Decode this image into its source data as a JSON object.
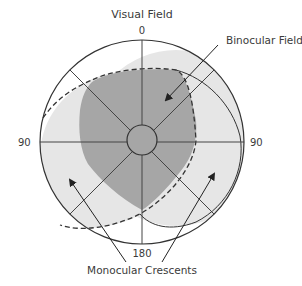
{
  "diagram": {
    "title": "Visual Field",
    "labels": {
      "top": "0",
      "bottom": "180",
      "left": "90",
      "right": "90",
      "binocular": "Binocular Field",
      "monocular": "Monocular Crescents"
    },
    "colors": {
      "binocular_fill": "#a6a6a6",
      "monocular_fill": "#e6e6e6",
      "stroke": "#333333",
      "text": "#3a3a3a"
    }
  }
}
